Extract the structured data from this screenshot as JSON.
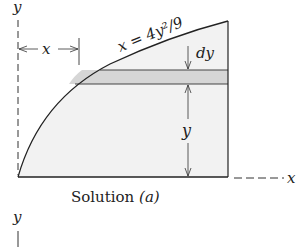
{
  "figure": {
    "equation_label": "x = 4y²/9",
    "axis_y_label": "y",
    "axis_x_label": "x",
    "width_label": "x",
    "strip_label": "dy",
    "height_label": "y",
    "caption_main": "Solution ",
    "caption_part": "(a)",
    "next_axis_y_label": "y",
    "colors": {
      "ink": "#222222",
      "region_fill": "#f2f2f2",
      "strip_fill": "#d6d6d6"
    }
  }
}
